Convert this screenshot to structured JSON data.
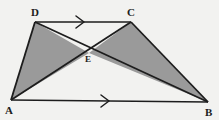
{
  "figure": {
    "canvas": {
      "width": 219,
      "height": 120
    },
    "background_color": "#f2f2f0",
    "stroke_color": "#1d1d1d",
    "shade_color": "#9a9a9a",
    "points": {
      "A": {
        "x": 11,
        "y": 100,
        "label": "A",
        "label_x": 6,
        "label_y": 105
      },
      "B": {
        "x": 208,
        "y": 102,
        "label": "B",
        "label_x": 205,
        "label_y": 107
      },
      "C": {
        "x": 131,
        "y": 22,
        "label": "C",
        "label_x": 127,
        "label_y": 9
      },
      "D": {
        "x": 35,
        "y": 22,
        "label": "D",
        "label_x": 31,
        "label_y": 9
      },
      "E": {
        "x": 89,
        "y": 53,
        "label": "E",
        "label_x": 85,
        "label_y": 55
      }
    },
    "segments": [
      {
        "name": "segment-AB",
        "from": "A",
        "to": "B",
        "parallel_mark": 1
      },
      {
        "name": "segment-DC",
        "from": "D",
        "to": "C",
        "parallel_mark": 1
      },
      {
        "name": "segment-AD",
        "from": "A",
        "to": "D",
        "parallel_mark": 0
      },
      {
        "name": "segment-CB",
        "from": "C",
        "to": "B",
        "parallel_mark": 0
      },
      {
        "name": "segment-AC",
        "from": "A",
        "to": "C",
        "parallel_mark": 0
      },
      {
        "name": "segment-DB",
        "from": "D",
        "to": "B",
        "parallel_mark": 0
      }
    ],
    "shaded_regions": [
      {
        "name": "triangle-ADE",
        "vertices": "A,D,E"
      },
      {
        "name": "triangle-ECB",
        "vertices": "E,C,B"
      }
    ],
    "parallel_arrows": [
      {
        "name": "arrow-on-DC",
        "x": 78,
        "y": 22,
        "direction": "right"
      },
      {
        "name": "arrow-on-AB",
        "x": 103,
        "y": 101,
        "direction": "right"
      }
    ]
  }
}
